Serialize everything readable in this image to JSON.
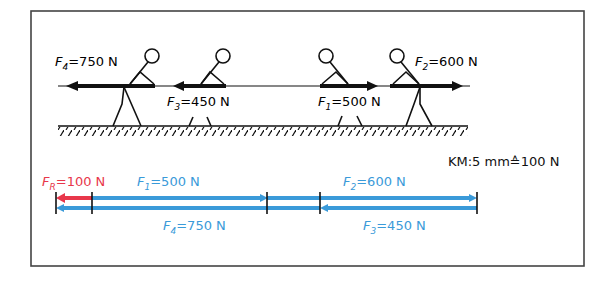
{
  "figure": {
    "frame": {
      "x": 31,
      "y": 11,
      "width": 553,
      "height": 255
    },
    "colors": {
      "line": "#111111",
      "blue": "#3a9ad9",
      "red": "#e8374b",
      "frame": "#444444"
    }
  },
  "scene": {
    "rope": {
      "y": 86,
      "x_start": 58,
      "x_end": 470
    },
    "ground": {
      "y": 126,
      "x_start": 58,
      "x_end": 468
    },
    "people": [
      {
        "id": "person-4",
        "x": 125,
        "facing": "left",
        "force": "F4"
      },
      {
        "id": "person-3",
        "x": 210,
        "facing": "left",
        "force": "F3"
      },
      {
        "id": "person-1",
        "x": 325,
        "facing": "right",
        "force": "F1"
      },
      {
        "id": "person-2",
        "x": 395,
        "facing": "right",
        "force": "F2"
      }
    ],
    "forces": [
      {
        "name": "F",
        "sub": "4",
        "value": "=750 N",
        "direction": "left"
      },
      {
        "name": "F",
        "sub": "3",
        "value": "=450 N",
        "direction": "left"
      },
      {
        "name": "F",
        "sub": "1",
        "value": "=500 N",
        "direction": "right"
      },
      {
        "name": "F",
        "sub": "2",
        "value": "=600 N",
        "direction": "right"
      }
    ]
  },
  "vector_diagram": {
    "scale_label": "KM:5 mm≙100 N",
    "resultant": {
      "name": "F",
      "sub": "R",
      "value": "=100 N",
      "color": "red"
    },
    "top_row": [
      {
        "name": "F",
        "sub": "1",
        "value": "=500 N"
      },
      {
        "name": "F",
        "sub": "2",
        "value": "=600 N"
      }
    ],
    "bottom_row": [
      {
        "name": "F",
        "sub": "4",
        "value": "=750 N"
      },
      {
        "name": "F",
        "sub": "3",
        "value": "=450 N"
      }
    ],
    "tick_positions_x": [
      56,
      92,
      267,
      320,
      477
    ]
  }
}
